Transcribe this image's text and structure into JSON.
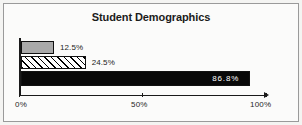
{
  "chart_data": {
    "type": "bar",
    "orientation": "horizontal",
    "title": "Student Demographics",
    "xlabel": "",
    "ylabel": "",
    "categories": [
      "series-1",
      "series-2",
      "series-3"
    ],
    "values": [
      12.5,
      24.5,
      86.8
    ],
    "data_labels": [
      "12.5%",
      "24.5%",
      "86.8%"
    ],
    "bar_styles": [
      "solid-gray",
      "diagonal-hatch",
      "solid-black"
    ],
    "bar_colors": [
      "#a9a9a9",
      "#ffffff",
      "#080808"
    ],
    "label_positions": [
      "outside-right",
      "outside-right",
      "inside-right"
    ],
    "xlim": [
      0,
      100
    ],
    "xticks": [
      0,
      50,
      100
    ],
    "xtick_labels": [
      "0%",
      "50%",
      "100%"
    ],
    "grid": false,
    "legend": false
  },
  "axis": {
    "tick_0": "0%",
    "tick_50": "50%",
    "tick_100": "100%"
  },
  "bars": {
    "bar1_label": "12.5%",
    "bar2_label": "24.5%",
    "bar3_label": "86.8%"
  },
  "colors": {
    "frame_border": "#9a9a9a",
    "plot_background": "#fbfbfa",
    "page_background": "#f4f4f2",
    "ink": "#1a1a1a",
    "bar_gray": "#a9a9a9",
    "bar_black": "#080808",
    "inside_label": "#ffffff"
  }
}
